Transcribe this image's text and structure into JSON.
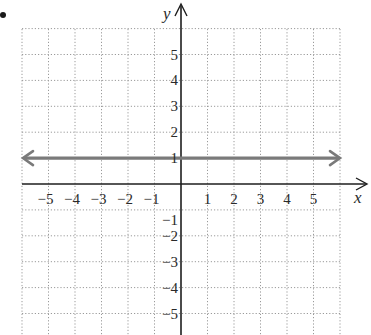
{
  "chart_data": {
    "type": "line",
    "title": "",
    "xlabel": "x",
    "ylabel": "y",
    "xlim": [
      -6.0,
      6.0
    ],
    "ylim": [
      -6.0,
      6.0
    ],
    "grid": true,
    "grid_style": "dotted",
    "x_ticks": [
      -5,
      -4,
      -3,
      -2,
      -1,
      1,
      2,
      3,
      4,
      5
    ],
    "y_ticks": [
      -5,
      -4,
      -3,
      -2,
      -1,
      1,
      2,
      3,
      4,
      5
    ],
    "x_tick_labels": [
      "−5",
      "−4",
      "−3",
      "−2",
      "−1",
      "1",
      "2",
      "3",
      "4",
      "5"
    ],
    "y_tick_labels": [
      "−5",
      "−4",
      "−3",
      "−2",
      "−1",
      "1",
      "2",
      "3",
      "4",
      "5"
    ],
    "series": [
      {
        "name": "y = 1",
        "equation": "y = 1",
        "x": [
          -6,
          6
        ],
        "y": [
          1,
          1
        ],
        "arrows": "both",
        "color": "#7a7a7a"
      }
    ],
    "legend": null
  },
  "marker": {
    "bullet": "•"
  },
  "colors": {
    "axis": "#1e1e1e",
    "grid": "#9a9a9a",
    "line": "#7a7a7a",
    "text": "#2a2a2a"
  }
}
